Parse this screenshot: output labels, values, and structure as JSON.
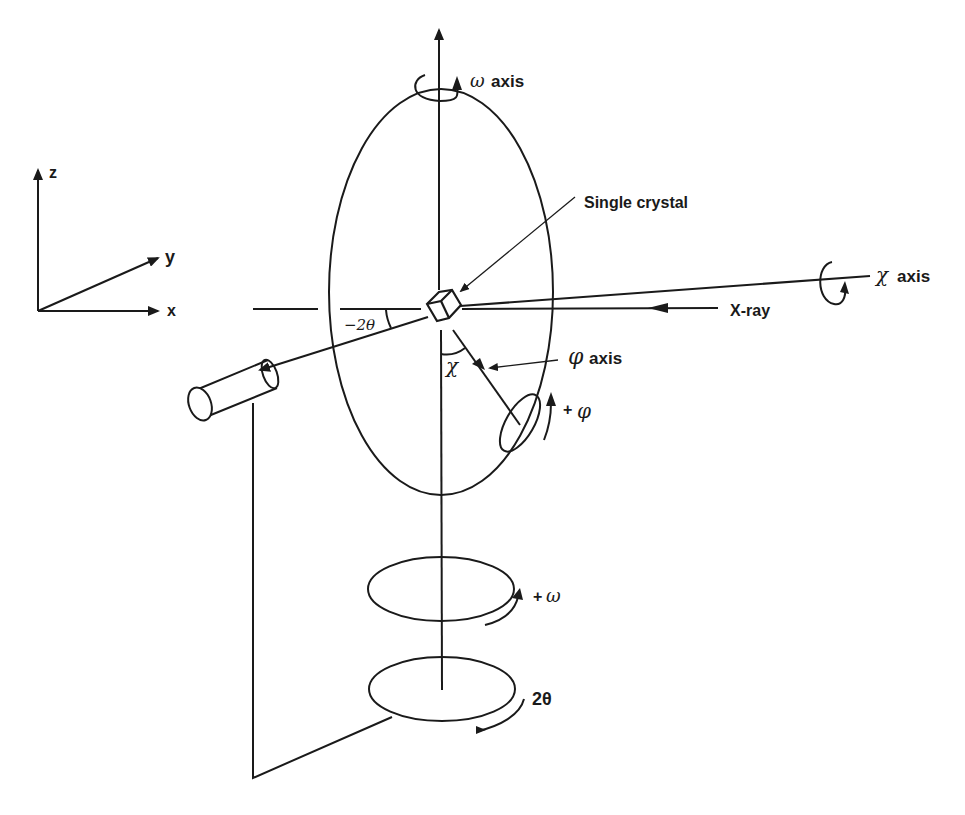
{
  "diagram": {
    "stroke_color": "#1a1a1a",
    "background": "#ffffff",
    "coordinate_axes": {
      "z_label": "z",
      "y_label": "y",
      "x_label": "x"
    },
    "labels": {
      "omega_symbol": "ω",
      "omega_axis": "axis",
      "single_crystal": "Single crystal",
      "chi_symbol": "χ",
      "chi_axis": "axis",
      "xray": "X-ray",
      "phi_symbol": "φ",
      "phi_axis": "axis",
      "plus_phi_sign": "+",
      "plus_phi_symbol": "φ",
      "minus_two_theta": "−2θ",
      "chi_angle": "χ",
      "plus_omega_sign": "+",
      "plus_omega_symbol": "ω",
      "two_theta": "2θ"
    },
    "components": [
      "omega-axis",
      "chi-circle",
      "single-crystal",
      "x-ray-beam",
      "chi-axis",
      "phi-axis",
      "phi-circle",
      "detector",
      "omega-circle",
      "two-theta-circle",
      "detector-arm"
    ]
  }
}
